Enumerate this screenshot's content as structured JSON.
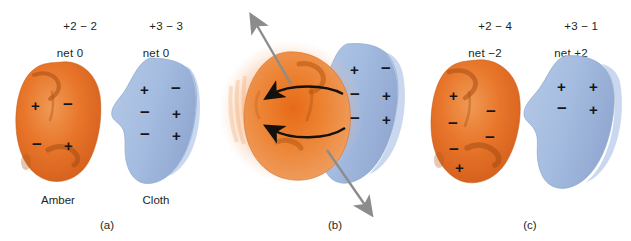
{
  "figure": {
    "colors": {
      "amber_fill": "#E8762A",
      "amber_dark": "#C0551A",
      "amber_light": "#F0A268",
      "amber_glow": "#F5A76B",
      "cloth_fill": "#A9C0E2",
      "cloth_light": "#C4D4EC",
      "cloth_edge": "#8FAAD4",
      "sign_color": "#14161c",
      "text_color": "#231f20",
      "motion_arrow": "#8C8C8C",
      "transfer_arrow": "#14100C",
      "background": "#FFFFFF"
    }
  },
  "panels": [
    {
      "id": "a",
      "label": "(a)",
      "amber": {
        "name": "Amber",
        "tally_line1": "+2 − 2",
        "tally_line2": "net 0",
        "signs": [
          "+",
          "−",
          "−",
          "+"
        ]
      },
      "cloth": {
        "name": "Cloth",
        "tally_line1": "+3 − 3",
        "tally_line2": "net 0",
        "signs": [
          "+",
          "−",
          "−",
          "+",
          "−",
          "+"
        ]
      }
    },
    {
      "id": "b",
      "label": "(b)",
      "amber": {
        "name": "Amber",
        "tally_line1": "",
        "tally_line2": "",
        "signs": []
      },
      "cloth": {
        "name": "Cloth",
        "tally_line1": "",
        "tally_line2": "",
        "signs": [
          "+",
          "−",
          "−",
          "+",
          "−",
          "+"
        ]
      },
      "annotations": {
        "motion_arrow_up": "rubbing-motion-up",
        "motion_arrow_down": "rubbing-motion-down",
        "transfer_arrow_top": "charge-transfer-arrow",
        "transfer_arrow_bottom": "charge-transfer-arrow"
      }
    },
    {
      "id": "c",
      "label": "(c)",
      "amber": {
        "name": "Amber",
        "tally_line1": "+2 − 4",
        "tally_line2": "net −2",
        "signs": [
          "+",
          "−",
          "−",
          "−",
          "−",
          "+"
        ]
      },
      "cloth": {
        "name": "Cloth",
        "tally_line1": "+3 − 1",
        "tally_line2": "net +2",
        "signs": [
          "+",
          "+",
          "−",
          "+"
        ]
      }
    }
  ]
}
